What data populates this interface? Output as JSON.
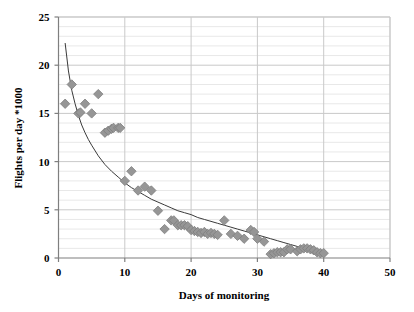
{
  "chart_data": {
    "type": "scatter",
    "title": "",
    "xlabel": "Days of monitoring",
    "ylabel": "Flights per day *1000",
    "xlim": [
      0,
      50
    ],
    "ylim": [
      0,
      25
    ],
    "xticks": [
      0,
      10,
      20,
      30,
      40,
      50
    ],
    "yticks": [
      0,
      5,
      10,
      15,
      20,
      25
    ],
    "xtick_labels": [
      "0",
      "10",
      "20",
      "30",
      "40",
      "50"
    ],
    "ytick_labels": [
      "0",
      "5",
      "10",
      "15",
      "20",
      "25"
    ],
    "grid": {
      "horizontal_minor_step": 1,
      "horizontal_major_step": 5,
      "vertical_major_step": 10,
      "horizontal": true,
      "vertical": true
    },
    "legend": null,
    "legend_position": "none",
    "marker": {
      "shape": "diamond",
      "color": "#969696",
      "edge_color": "#7d7d7d",
      "size": 7
    },
    "trendline": {
      "style": "solid",
      "color": "#3a3a3a",
      "width": 1,
      "description": "power/decay fit curve through scatter",
      "points": [
        [
          1.0,
          22.3
        ],
        [
          1.5,
          19.4
        ],
        [
          2.0,
          17.4
        ],
        [
          2.5,
          16.0
        ],
        [
          3.0,
          14.8
        ],
        [
          3.5,
          13.8
        ],
        [
          4.0,
          13.0
        ],
        [
          4.5,
          12.3
        ],
        [
          5.0,
          11.7
        ],
        [
          6.0,
          10.6
        ],
        [
          7.0,
          9.7
        ],
        [
          8.0,
          9.0
        ],
        [
          9.0,
          8.4
        ],
        [
          10.0,
          7.8
        ],
        [
          11.0,
          7.3
        ],
        [
          12.0,
          6.9
        ],
        [
          13.0,
          6.5
        ],
        [
          14.0,
          6.1
        ],
        [
          15.0,
          5.8
        ],
        [
          16.0,
          5.5
        ],
        [
          17.0,
          5.2
        ],
        [
          18.0,
          4.9
        ],
        [
          19.0,
          4.7
        ],
        [
          20.0,
          4.5
        ],
        [
          21.0,
          4.2
        ],
        [
          22.0,
          4.0
        ],
        [
          23.0,
          3.8
        ],
        [
          24.0,
          3.6
        ],
        [
          25.0,
          3.4
        ],
        [
          26.0,
          3.2
        ],
        [
          27.0,
          3.0
        ],
        [
          28.0,
          2.8
        ],
        [
          29.0,
          2.6
        ],
        [
          30.0,
          2.4
        ],
        [
          31.0,
          2.2
        ],
        [
          32.0,
          2.0
        ],
        [
          33.0,
          1.8
        ],
        [
          34.0,
          1.6
        ],
        [
          35.0,
          1.4
        ],
        [
          36.0,
          1.2
        ],
        [
          37.0,
          1.0
        ],
        [
          38.0,
          0.8
        ],
        [
          39.0,
          0.6
        ],
        [
          40.0,
          0.4
        ]
      ]
    },
    "series": [
      {
        "name": "Flights per day",
        "points": [
          [
            1,
            16.0
          ],
          [
            2,
            18.0
          ],
          [
            3,
            15.0
          ],
          [
            3.3,
            15.1
          ],
          [
            4,
            16.0
          ],
          [
            5,
            15.0
          ],
          [
            6,
            17.0
          ],
          [
            7,
            13.0
          ],
          [
            7.5,
            13.2
          ],
          [
            8,
            13.4
          ],
          [
            8.3,
            13.5
          ],
          [
            9,
            13.5
          ],
          [
            9.3,
            13.5
          ],
          [
            10,
            8.0
          ],
          [
            11,
            9.0
          ],
          [
            12,
            7.0
          ],
          [
            13,
            7.4
          ],
          [
            14,
            7.0
          ],
          [
            15,
            4.9
          ],
          [
            16,
            3.0
          ],
          [
            17,
            3.9
          ],
          [
            17.4,
            3.9
          ],
          [
            18,
            3.4
          ],
          [
            18.5,
            3.4
          ],
          [
            19,
            3.4
          ],
          [
            19.5,
            3.3
          ],
          [
            20,
            2.9
          ],
          [
            20.5,
            2.8
          ],
          [
            21,
            2.7
          ],
          [
            21.5,
            2.6
          ],
          [
            22,
            2.7
          ],
          [
            22.5,
            2.5
          ],
          [
            23,
            2.6
          ],
          [
            23.5,
            2.5
          ],
          [
            24,
            2.4
          ],
          [
            25,
            3.9
          ],
          [
            26,
            2.5
          ],
          [
            27,
            2.3
          ],
          [
            28,
            2.0
          ],
          [
            29,
            2.9
          ],
          [
            29.5,
            2.7
          ],
          [
            30,
            2.0
          ],
          [
            31,
            1.7
          ],
          [
            32,
            0.4
          ],
          [
            32.5,
            0.5
          ],
          [
            33,
            0.6
          ],
          [
            33.5,
            0.6
          ],
          [
            34,
            0.6
          ],
          [
            34.5,
            0.9
          ],
          [
            35,
            0.9
          ],
          [
            36,
            0.7
          ],
          [
            36.5,
            0.9
          ],
          [
            37,
            1.0
          ],
          [
            37.5,
            1.0
          ],
          [
            38,
            0.9
          ],
          [
            38.5,
            0.8
          ],
          [
            39,
            0.6
          ],
          [
            39.5,
            0.5
          ],
          [
            40,
            0.5
          ]
        ]
      }
    ]
  },
  "colors": {
    "marker": "#969696",
    "trendline": "#3a3a3a",
    "axis": "#7f7f7f",
    "grid_minor": "#e8e8e8",
    "grid_major": "#c9c9c9",
    "background": "#ffffff",
    "text": "#000000"
  }
}
